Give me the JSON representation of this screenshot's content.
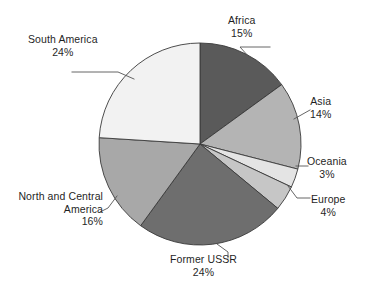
{
  "chart_data": {
    "type": "pie",
    "title": "",
    "subtitle": "",
    "xlabel": "",
    "ylabel": "",
    "legend_position": "none",
    "grid": false,
    "unit": "%",
    "start_angle_deg": 0,
    "direction": "clockwise",
    "total": 100,
    "categories": [
      "Africa",
      "Asia",
      "Oceania",
      "Europe",
      "Former USSR",
      "North and Central America",
      "South America"
    ],
    "values": [
      15,
      14,
      3,
      4,
      24,
      16,
      24
    ],
    "slices": [
      {
        "label": "Africa",
        "label_line1": "Africa",
        "value": 15,
        "value_label": "15%",
        "color": "#5a5a5a",
        "start_pct": 0,
        "end_pct": 15
      },
      {
        "label": "Asia",
        "label_line1": "Asia",
        "value": 14,
        "value_label": "14%",
        "color": "#b4b4b4",
        "start_pct": 15,
        "end_pct": 29
      },
      {
        "label": "Oceania",
        "label_line1": "Oceania",
        "value": 3,
        "value_label": "3%",
        "color": "#e4e4e4",
        "start_pct": 29,
        "end_pct": 32
      },
      {
        "label": "Europe",
        "label_line1": "Europe",
        "value": 4,
        "value_label": "4%",
        "color": "#c6c6c6",
        "start_pct": 32,
        "end_pct": 36
      },
      {
        "label": "Former USSR",
        "label_line1": "Former USSR",
        "value": 24,
        "value_label": "24%",
        "color": "#6e6e6e",
        "start_pct": 36,
        "end_pct": 60
      },
      {
        "label": "North and Central America",
        "label_line1": "North and Central",
        "label_line2": "America",
        "value": 16,
        "value_label": "16%",
        "color": "#a8a8a8",
        "start_pct": 60,
        "end_pct": 76
      },
      {
        "label": "South America",
        "label_line1": "South America",
        "value": 24,
        "value_label": "24%",
        "color": "#f2f2f2",
        "start_pct": 76,
        "end_pct": 100
      }
    ],
    "colors": {
      "outline": "#3a3a3a",
      "leader_line": "#555555",
      "text": "#1f1f1f",
      "background": "#ffffff"
    },
    "geometry": {
      "center_x": 200,
      "center_y": 144,
      "radius": 101
    }
  }
}
